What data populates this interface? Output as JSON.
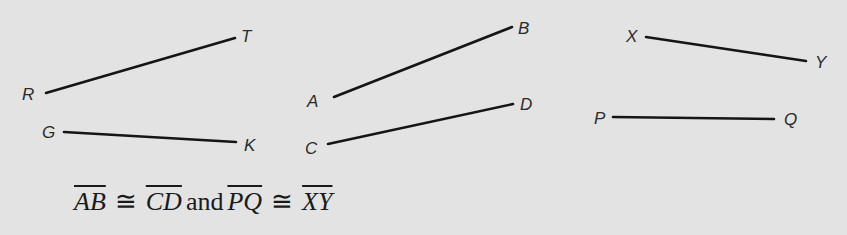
{
  "figure": {
    "segments": [
      {
        "name": "RT",
        "p1": {
          "label": "R",
          "x": 46,
          "y": 93
        },
        "p2": {
          "label": "T",
          "x": 235,
          "y": 38
        },
        "label_pos": {
          "R": [
            22,
            100
          ],
          "T": [
            241,
            42
          ]
        }
      },
      {
        "name": "GK",
        "p1": {
          "label": "G",
          "x": 64,
          "y": 132
        },
        "p2": {
          "label": "K",
          "x": 236,
          "y": 142
        },
        "label_pos": {
          "G": [
            42,
            138
          ],
          "K": [
            244,
            151
          ]
        }
      },
      {
        "name": "AB",
        "p1": {
          "label": "A",
          "x": 334,
          "y": 97
        },
        "p2": {
          "label": "B",
          "x": 512,
          "y": 27
        },
        "label_pos": {
          "A": [
            307,
            107
          ],
          "B": [
            518,
            34
          ]
        }
      },
      {
        "name": "CD",
        "p1": {
          "label": "C",
          "x": 328,
          "y": 144
        },
        "p2": {
          "label": "D",
          "x": 513,
          "y": 104
        },
        "label_pos": {
          "C": [
            305,
            154
          ],
          "D": [
            520,
            110
          ]
        }
      },
      {
        "name": "XY",
        "p1": {
          "label": "X",
          "x": 646,
          "y": 37
        },
        "p2": {
          "label": "Y",
          "x": 806,
          "y": 61
        },
        "label_pos": {
          "X": [
            626,
            42
          ],
          "Y": [
            815,
            68
          ]
        }
      },
      {
        "name": "PQ",
        "p1": {
          "label": "P",
          "x": 613,
          "y": 117
        },
        "p2": {
          "label": "Q",
          "x": 774,
          "y": 119
        },
        "label_pos": {
          "P": [
            594,
            124
          ],
          "Q": [
            784,
            125
          ]
        }
      }
    ]
  },
  "caption": {
    "seg1": "AB",
    "cong1": "≅",
    "seg2": "CD",
    "conj": "and",
    "seg3": "PQ",
    "cong2": "≅",
    "seg4": "XY"
  }
}
